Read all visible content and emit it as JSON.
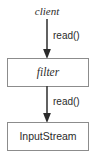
{
  "diagram": {
    "type": "flow-diagram",
    "background_color": "#ffffff",
    "border_color": "#8c8c8c",
    "text_color": "#2b2b2b",
    "arrow_color": "#3a3a3a",
    "nodes": [
      {
        "id": "client",
        "label": "client",
        "shape": "plain-text",
        "style": "italic"
      },
      {
        "id": "filter",
        "label": "filter",
        "shape": "rectangle",
        "style": "italic"
      },
      {
        "id": "inputstream",
        "label": "InputStream",
        "shape": "rectangle",
        "style": "normal"
      }
    ],
    "edges": [
      {
        "id": "client-to-filter",
        "from": "client",
        "to": "filter",
        "label": "read()",
        "direction": "down",
        "arrowhead": "solid-triangle"
      },
      {
        "id": "filter-to-inputstream",
        "from": "filter",
        "to": "inputstream",
        "label": "read()",
        "direction": "down",
        "arrowhead": "solid-triangle"
      }
    ]
  }
}
